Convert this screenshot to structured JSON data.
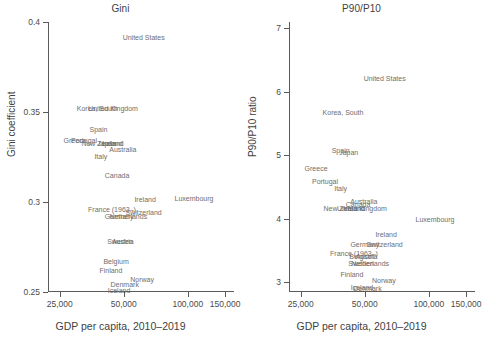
{
  "figure": {
    "width": 482,
    "height": 345,
    "background": "#ffffff",
    "text_color": "#595959"
  },
  "chart_data": [
    {
      "type": "scatter",
      "title": "Gini",
      "xlabel": "GDP per capita, 2010–2019",
      "ylabel": "Gini coefficient",
      "xscale": "log",
      "xlim": [
        22000,
        165000
      ],
      "ylim": [
        0.25,
        0.4
      ],
      "xticks": [
        25000,
        50000,
        100000,
        150000
      ],
      "xticklabels": [
        "25,000",
        "50,000",
        "100,000",
        "150,000"
      ],
      "yticks": [
        0.25,
        0.3,
        0.35,
        0.4
      ],
      "yticklabels": [
        "0.25",
        "0.3",
        "0.35",
        "0.4"
      ],
      "grid": false,
      "legend": "none",
      "marker_style": "text-label",
      "points": [
        {
          "label": "United States",
          "x": 62000,
          "y": 0.3915
        },
        {
          "label": "Korea, South",
          "x": 37500,
          "y": 0.3525
        },
        {
          "label": "United Kingdom",
          "x": 44500,
          "y": 0.3525
        },
        {
          "label": "Spain",
          "x": 38000,
          "y": 0.3405
        },
        {
          "label": "Greece",
          "x": 29500,
          "y": 0.3345
        },
        {
          "label": "Portugal",
          "x": 32500,
          "y": 0.3345
        },
        {
          "label": "New Zealand",
          "x": 39500,
          "y": 0.333
        },
        {
          "label": "Japan",
          "x": 41500,
          "y": 0.333
        },
        {
          "label": "Ireland",
          "x": 44500,
          "y": 0.333
        },
        {
          "label": "Australia",
          "x": 49500,
          "y": 0.3295
        },
        {
          "label": "Italy",
          "x": 39000,
          "y": 0.3255
        },
        {
          "label": "Canada",
          "x": 46500,
          "y": 0.315
        },
        {
          "label": "Ireland",
          "x": 63000,
          "y": 0.3015
        },
        {
          "label": "Luxembourg",
          "x": 107000,
          "y": 0.3025
        },
        {
          "label": "France (1963–)",
          "x": 44000,
          "y": 0.296
        },
        {
          "label": "Switzerland",
          "x": 62000,
          "y": 0.2945
        },
        {
          "label": "Germany",
          "x": 47500,
          "y": 0.2925
        },
        {
          "label": "Netherlands",
          "x": 52500,
          "y": 0.2925
        },
        {
          "label": "Austria",
          "x": 49500,
          "y": 0.2785
        },
        {
          "label": "Sweden",
          "x": 48000,
          "y": 0.2785
        },
        {
          "label": "Belgium",
          "x": 46000,
          "y": 0.2675
        },
        {
          "label": "Finland",
          "x": 43500,
          "y": 0.2625
        },
        {
          "label": "Denmark",
          "x": 50500,
          "y": 0.2545
        },
        {
          "label": "Norway",
          "x": 61000,
          "y": 0.2575
        },
        {
          "label": "Iceland",
          "x": 47500,
          "y": 0.251
        }
      ]
    },
    {
      "type": "scatter",
      "title": "P90/P10",
      "xlabel": "GDP per capita, 2010–2019",
      "ylabel": "P90/P10 ratio",
      "xscale": "log",
      "xlim": [
        22000,
        165000
      ],
      "ylim": [
        2.85,
        7.1
      ],
      "xticks": [
        25000,
        50000,
        100000,
        150000
      ],
      "xticklabels": [
        "25,000",
        "50,000",
        "100,000",
        "150,000"
      ],
      "yticks": [
        3,
        4,
        5,
        6,
        7
      ],
      "yticklabels": [
        "3",
        "4",
        "5",
        "6",
        "7"
      ],
      "grid": false,
      "legend": "none",
      "marker_style": "text-label",
      "points": [
        {
          "label": "United States",
          "x": 62000,
          "y": 6.22
        },
        {
          "label": "Korea, South",
          "x": 39500,
          "y": 5.68
        },
        {
          "label": "Spain",
          "x": 38500,
          "y": 5.09
        },
        {
          "label": "Japan",
          "x": 42000,
          "y": 5.06
        },
        {
          "label": "Greece",
          "x": 29500,
          "y": 4.8
        },
        {
          "label": "Portugal",
          "x": 32500,
          "y": 4.6
        },
        {
          "label": "Italy",
          "x": 38500,
          "y": 4.49
        },
        {
          "label": "Australia",
          "x": 49500,
          "y": 4.29
        },
        {
          "label": "Canada",
          "x": 46500,
          "y": 4.23
        },
        {
          "label": "New Zealand",
          "x": 40000,
          "y": 4.17
        },
        {
          "label": "United Kingdom",
          "x": 48500,
          "y": 4.17
        },
        {
          "label": "Ireland",
          "x": 44500,
          "y": 4.17
        },
        {
          "label": "Luxembourg",
          "x": 107000,
          "y": 4.0
        },
        {
          "label": "Ireland",
          "x": 63000,
          "y": 3.77
        },
        {
          "label": "Germany",
          "x": 50000,
          "y": 3.61
        },
        {
          "label": "Switzerland",
          "x": 62000,
          "y": 3.61
        },
        {
          "label": "France (1963–)",
          "x": 44500,
          "y": 3.47
        },
        {
          "label": "Belgium",
          "x": 48500,
          "y": 3.41
        },
        {
          "label": "Austria",
          "x": 51000,
          "y": 3.42
        },
        {
          "label": "Sweden",
          "x": 48000,
          "y": 3.3
        },
        {
          "label": "Netherlands",
          "x": 53000,
          "y": 3.3
        },
        {
          "label": "Finland",
          "x": 43500,
          "y": 3.13
        },
        {
          "label": "Norway",
          "x": 61500,
          "y": 3.04
        },
        {
          "label": "Iceland",
          "x": 48500,
          "y": 2.93
        },
        {
          "label": "Denmark",
          "x": 51500,
          "y": 2.91
        }
      ]
    }
  ]
}
